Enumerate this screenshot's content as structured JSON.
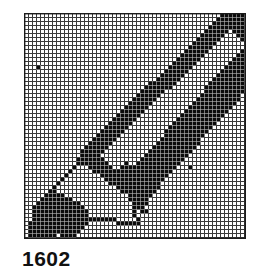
{
  "plate": {
    "width": 260,
    "height": 277,
    "background": "#ffffff",
    "kind": "bitmap-design-grid"
  },
  "caption": {
    "text": "1602",
    "label_name": "figure-number"
  },
  "grid": {
    "left": 24,
    "top": 13,
    "width": 222,
    "height": 226,
    "columns": 55,
    "rows": 56,
    "cell_px": 4,
    "line_color": "#3a3a3a",
    "line_width_px": 1,
    "fill_color": "#0a0a0a",
    "empty_color": "#ffffff",
    "border_color": "#1a1a1a"
  },
  "artwork": {
    "name": "pencil",
    "description": "Diagonal pencil icon: sharpened graphite tip at lower-left, wooden cone, banded barrel running to upper-right corner.",
    "axis": {
      "comment": "Pencil long axis in cell coords, from tip point to butt end.",
      "tip": [
        3,
        53
      ],
      "butt": [
        54,
        1
      ]
    },
    "shapes": [
      {
        "name": "graphite-tip",
        "type": "polygon",
        "fill": "solid",
        "points": [
          [
            1,
            55
          ],
          [
            2,
            48
          ],
          [
            7,
            44
          ],
          [
            13,
            47
          ],
          [
            16,
            51
          ],
          [
            12,
            55
          ],
          [
            4,
            56
          ]
        ]
      },
      {
        "name": "wood-cone-outline",
        "type": "polygon",
        "fill": "outline",
        "points": [
          [
            2,
            48
          ],
          [
            14,
            36
          ],
          [
            26,
            45
          ],
          [
            28,
            52
          ],
          [
            16,
            51
          ],
          [
            7,
            44
          ]
        ]
      },
      {
        "name": "ferrule-band",
        "type": "polygon",
        "fill": "solid",
        "points": [
          [
            13,
            36
          ],
          [
            18,
            31
          ],
          [
            31,
            43
          ],
          [
            29,
            49
          ],
          [
            26,
            45
          ]
        ]
      },
      {
        "name": "barrel-edge-upper",
        "type": "band",
        "fill": "solid",
        "start": [
          14,
          34
        ],
        "end": [
          50,
          0
        ],
        "thickness": 5,
        "comment": "Upper-left dark edge of the barrel."
      },
      {
        "name": "barrel-facet-light",
        "type": "band",
        "fill": "empty",
        "start": [
          19,
          35
        ],
        "end": [
          54,
          2
        ],
        "thickness": 6,
        "comment": "White highlight facet running the length of the barrel."
      },
      {
        "name": "barrel-edge-lower",
        "type": "band",
        "fill": "solid",
        "start": [
          25,
          41
        ],
        "end": [
          55,
          8
        ],
        "thickness": 8,
        "comment": "Lower-right dark facet of the barrel."
      },
      {
        "name": "butt-end-cap",
        "type": "polygon",
        "fill": "solid",
        "points": [
          [
            49,
            0
          ],
          [
            55,
            0
          ],
          [
            55,
            7
          ],
          [
            52,
            4
          ]
        ]
      }
    ],
    "stray_marks": [
      {
        "name": "stray-dot-upper-left",
        "cell": [
          3,
          13
        ]
      },
      {
        "name": "stray-dot-mid-right",
        "cell": [
          41,
          38
        ]
      },
      {
        "name": "stray-dot-lower-mid",
        "cell": [
          30,
          49
        ]
      }
    ]
  }
}
